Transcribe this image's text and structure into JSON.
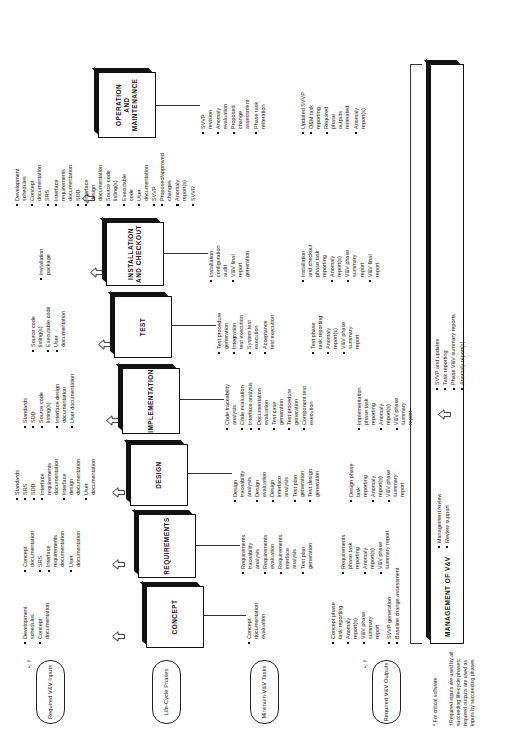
{
  "row_labels": [
    {
      "id": "required-vv-inputs",
      "label": "Required\nV&V Inputs"
    },
    {
      "id": "life-cycle-phases",
      "label": "Life-Cycle\nPhases"
    },
    {
      "id": "minimum-vv-tasks",
      "label": "Minimum\nV&V Tasks"
    },
    {
      "id": "required-vv-outputs",
      "label": "Required\nV&V Outputs"
    }
  ],
  "dagger_marks": [
    {
      "id": "inputs-dagger",
      "text": "•, †"
    },
    {
      "id": "outputs-dagger",
      "text": "•, †"
    }
  ],
  "footnotes": {
    "critical": "* For critical software",
    "reuse": "†Required inputs are used by all\nsucceeding life-cycle phases;\nrequired outputs are used as\ninputs by succeeding phases"
  },
  "management": {
    "title": "MANAGEMENT OF V&V",
    "inputs": [
      "SVVP generation",
      "Baseline change assessment"
    ],
    "tasks": [
      "Management review",
      "Review support"
    ],
    "outputs": [
      "SVVP and updates",
      "Task reporting",
      "Phase V&V summary reports",
      "Anomaly report(s)"
    ]
  },
  "phases": [
    {
      "id": "concept",
      "name": "CONCEPT",
      "inputs": [
        "Development\nschedules",
        "Concept\ndocumentation"
      ],
      "tasks": [
        "Concept\ndocumentation\nevaluation"
      ],
      "outputs": [
        "Concept phase\ntask reporting",
        "Anomaly\nreport(s)",
        "V&V phase\nsummary\nreport"
      ]
    },
    {
      "id": "requirements",
      "name": "REQUIREMENTS",
      "inputs": [
        "Concept\ndocumentation",
        "SRS",
        "Interface\nrequirements\ndocumentation",
        "User\ndocumentation"
      ],
      "tasks": [
        "Requirements\ntraceability\nanalysis",
        "Requirements\nevaluation",
        "Requirements\ninterface\nanalysis",
        "Test plan\ngeneration"
      ],
      "outputs": [
        "Requirements\nphase task\nreporting",
        "Anomaly\nreport(s)",
        "V&V phase\nsummary report"
      ]
    },
    {
      "id": "design",
      "name": "DESIGN",
      "inputs": [
        "Standards",
        "SRS",
        "SDD",
        "Interface\nrequirements\ndocumentation",
        "Interface\ndesign\ndocumentation",
        "User\ndocumentation"
      ],
      "tasks": [
        "Design\ntraceability\nanalysis",
        "Design\nevaluation",
        "Design\ninterface\nanalysis",
        "Test plan\ngeneration",
        "Test design\ngeneration"
      ],
      "outputs": [
        "Design phase\ntask\nreporting",
        "Anomaly\nreport(s)",
        "V&V phase\nsummary\nreport"
      ]
    },
    {
      "id": "implementation",
      "name": "IMPLEMENTATION",
      "inputs": [
        "Standards",
        "SDD",
        "Source code\nlisting(s)",
        "Interface design\ndocumentation",
        "User documentation"
      ],
      "tasks": [
        "Code traceability\nanalysis",
        "Code evaluation",
        "Interface analysis",
        "Documentation\nevaluation",
        "Test case\ngeneration",
        "Test procedure\ngeneration",
        "Component test\nexecution"
      ],
      "outputs": [
        "Implementation\nphase task\nreporting",
        "Anomaly\nreport(s)",
        "V&V phase\nsummary\nreport"
      ]
    },
    {
      "id": "test",
      "name": "TEST",
      "inputs": [
        "Source code\nlisting(s)",
        "Executable code",
        "User\ndocumentation"
      ],
      "tasks": [
        "Test procedure\ngeneration",
        "Integration\ntest execution",
        "System test\nexecution",
        "Acceptance\ntest execution"
      ],
      "outputs": [
        "Test phase\ntask reporting",
        "Anomaly\nreport(s)",
        "V&V phase\nsummary\nreport"
      ]
    },
    {
      "id": "installation-and-checkout",
      "name": "INSTALLATION\nAND CHECKOUT",
      "inputs": [
        "Installation\npackage"
      ],
      "tasks": [
        "Installation\nconfiguration\naudit",
        "V&V final\nreport\ngeneration"
      ],
      "outputs": [
        "Installation\nand checkout\nphase task\nreporting",
        "Anomaly\nreport(s)",
        "V&V phase\nsummary\nreport",
        "V&V final\nreport"
      ]
    },
    {
      "id": "operation-and-maintenance",
      "name": "OPERATION\nAND\nMAINTENANCE",
      "inputs": [
        "Development\nschedules",
        "Concept\ndocumentation",
        "SRS",
        "Interface\nrequirements\ndocumentation",
        "SDD",
        "Interface\ndesign\ndocumentation",
        "Source code\nlisting(s)",
        "Executable\ncode",
        "User\ndocumentation",
        "SVVP",
        "Proposed/approved\nchanges",
        "Anomaly\nreport(s)",
        "SVVR"
      ],
      "tasks": [
        "SVVP\nrevision",
        "Anomaly\nevaluation",
        "Proposed\nchange\nassessment",
        "Phase task\nreiteration"
      ],
      "outputs": [
        "Updated SVVP",
        "O&M task\nreporting",
        "Required\nphase\noutputs\nreiterated",
        "Anomaly\nreport(s)"
      ]
    }
  ],
  "icons": {
    "flow_arrow": "hollow-chevron-arrow"
  },
  "colors": {
    "ink": "#111111",
    "rule": "#333333",
    "paper": "#ffffff"
  }
}
